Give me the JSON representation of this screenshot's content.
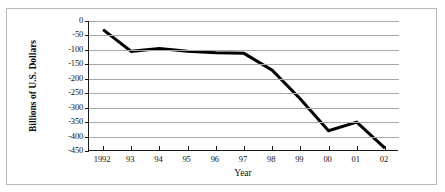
{
  "chart_data": {
    "type": "line",
    "title": "",
    "xlabel": "Year",
    "ylabel": "Billions of U.S. Dollars",
    "x": [
      1992,
      1993,
      1994,
      1995,
      1996,
      1997,
      1998,
      1999,
      2000,
      2001,
      2002
    ],
    "tick_labels": [
      "1992",
      "93",
      "94",
      "95",
      "96",
      "97",
      "98",
      "99",
      "00",
      "01",
      "02"
    ],
    "values": [
      -30,
      -105,
      -95,
      -105,
      -110,
      -112,
      -170,
      -270,
      -380,
      -350,
      -440
    ],
    "ylim": [
      -450,
      0
    ],
    "ytick_labels": [
      "0",
      "-50",
      "-100",
      "-150",
      "-200",
      "-250",
      "-300",
      "-350",
      "-400",
      "-450"
    ],
    "ytick_values": [
      0,
      -50,
      -100,
      -150,
      -200,
      -250,
      -300,
      -350,
      -400,
      -450
    ],
    "grid": true,
    "legend": "none",
    "series": [
      {
        "name": "Deficit",
        "color": "#000000",
        "values": [
          -30,
          -105,
          -95,
          -105,
          -110,
          -112,
          -170,
          -270,
          -380,
          -350,
          -440
        ]
      }
    ],
    "point_offset_note": "data points plotted at mid-interval between x tick marks"
  },
  "colors": {
    "line": "#000000",
    "grid": "#a8a8a8",
    "axis": "#1a1a1a",
    "frame": "#b9b9b9",
    "background": "#ffffff",
    "text": "#111111"
  }
}
